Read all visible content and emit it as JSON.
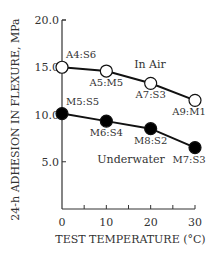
{
  "chart_data": {
    "type": "line",
    "title": "",
    "xlabel": "TEST TEMPERATURE (°C)",
    "ylabel": "24-h ADHESION IN FLEXURE, MPa",
    "x": [
      0,
      10,
      20,
      30
    ],
    "xticks": [
      "0",
      "10",
      "20",
      "30"
    ],
    "yticks": [
      "5.0",
      "10.0",
      "15.0",
      "20.0"
    ],
    "xlim": [
      0,
      30
    ],
    "ylim": [
      0,
      20
    ],
    "grid": false,
    "legend": "inline labels",
    "series": [
      {
        "name": "In Air",
        "marker": "open-circle",
        "values": [
          15.0,
          14.6,
          13.3,
          11.5
        ],
        "point_labels": [
          "A4:S6",
          "A5:M5",
          "A7:S3",
          "A9:M1"
        ]
      },
      {
        "name": "Underwater",
        "marker": "filled-circle",
        "values": [
          10.1,
          9.3,
          8.5,
          6.5
        ],
        "point_labels": [
          "M5:S5",
          "M6:S4",
          "M8:S2",
          "M7:S3"
        ]
      }
    ]
  }
}
